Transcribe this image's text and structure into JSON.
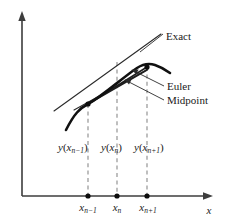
{
  "figure": {
    "background_color": "#ffffff",
    "axis_color": "#3d3d3d",
    "curve_color": "#111111",
    "dash_color": "#8a8a8a"
  },
  "axes": {
    "x_axis_label": "x",
    "y_axis_label": "",
    "origin_px": {
      "x": 22,
      "y": 196
    },
    "x_axis_end_px": {
      "x": 213,
      "y": 196
    },
    "y_axis_top_px": {
      "x": 22,
      "y": 14
    }
  },
  "ticks": [
    {
      "id": "tick-n-minus-1",
      "base": "x",
      "sub": "n−1",
      "x_px": 88
    },
    {
      "id": "tick-n",
      "base": "x",
      "sub": "n",
      "x_px": 117
    },
    {
      "id": "tick-n-plus-1",
      "base": "x",
      "sub": "n+1",
      "x_px": 147
    }
  ],
  "value_labels": [
    {
      "id": "value-label-n-minus-1",
      "base": "y",
      "arg": "x",
      "sub": "n−1",
      "x_px": 58,
      "y_px": 147
    },
    {
      "id": "value-label-n",
      "base": "y",
      "arg": "x",
      "sub": "n",
      "x_px": 101,
      "y_px": 147
    },
    {
      "id": "value-label-n-plus-1",
      "base": "y",
      "arg": "x",
      "sub": "n+1",
      "x_px": 134,
      "y_px": 147
    }
  ],
  "annotations": [
    {
      "id": "annotation-exact",
      "label": "Exact",
      "text_x_px": 166,
      "text_y_px": 37,
      "leader_from_px": {
        "x": 163,
        "y": 34
      },
      "leader_to_px": {
        "x": 116,
        "y": 70
      },
      "has_arrowhead": false
    },
    {
      "id": "annotation-euler",
      "label": "Euler",
      "text_x_px": 167,
      "text_y_px": 89,
      "leader_from_px": {
        "x": 164,
        "y": 86
      },
      "leader_to_px": {
        "x": 132,
        "y": 71
      },
      "has_arrowhead": true
    },
    {
      "id": "annotation-midpoint",
      "label": "Midpoint",
      "text_x_px": 167,
      "text_y_px": 103,
      "leader_from_px": {
        "x": 164,
        "y": 100
      },
      "leader_to_px": {
        "x": 125,
        "y": 81
      },
      "has_arrowhead": true
    }
  ],
  "curves": {
    "exact": {
      "name": "exact-solution-curve",
      "path": "M 66,130 C 74,114 80,108 88,104 C 104,95 122,78 137,68 C 143,64 149,63 155,65 C 161,67 166,70 170,73"
    },
    "tangent_long": {
      "name": "tangent-line-through-node",
      "path": "M 54,111 L 161,34"
    },
    "euler_step": {
      "name": "euler-step-segment",
      "path": "M 88,104 L 147,67"
    },
    "midpoint_step": {
      "name": "midpoint-step-segment",
      "path": "M 88,104 L 147,70"
    },
    "secondary_line": {
      "name": "secondary-slope-line",
      "path": "M 74,110 L 148,69"
    }
  },
  "markers": [
    {
      "id": "node-x-n-minus-1",
      "x_px": 88,
      "y_px": 104
    },
    {
      "id": "node-x-n-plus-1",
      "x_px": 147,
      "y_px": 67
    },
    {
      "id": "axis-dot-n-minus-1",
      "x_px": 88,
      "y_px": 196
    },
    {
      "id": "axis-dot-n",
      "x_px": 117,
      "y_px": 196
    },
    {
      "id": "axis-dot-n-plus-1",
      "x_px": 147,
      "y_px": 196
    }
  ],
  "dashed_lines": [
    {
      "id": "dashed-n-minus-1",
      "x_px": 88,
      "y_top_px": 104,
      "y_bottom_px": 194
    },
    {
      "id": "dashed-n",
      "x_px": 117,
      "y_top_px": 62,
      "y_bottom_px": 194
    },
    {
      "id": "dashed-n-plus-1",
      "x_px": 147,
      "y_top_px": 67,
      "y_bottom_px": 194
    }
  ]
}
